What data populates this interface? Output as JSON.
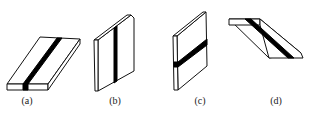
{
  "figure": {
    "panels": [
      {
        "id": "a",
        "label": "(a)",
        "orientation": "flat"
      },
      {
        "id": "b",
        "label": "(b)",
        "orientation": "vertical"
      },
      {
        "id": "c",
        "label": "(c)",
        "orientation": "horizontal"
      },
      {
        "id": "d",
        "label": "(d)",
        "orientation": "overhead"
      }
    ]
  },
  "colors": {
    "stroke": "#111111",
    "bead": "#000000",
    "background": "#ffffff"
  }
}
